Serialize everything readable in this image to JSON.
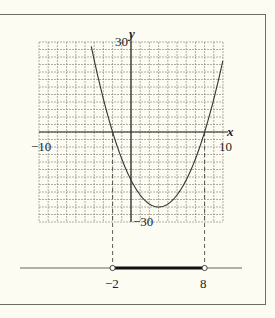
{
  "chart_data": {
    "type": "line",
    "title": "",
    "function": "y = x^2 - 6x - 16 = (x + 2)(x - 8)",
    "xlabel": "x",
    "ylabel": "y",
    "xlim": [
      -10,
      10
    ],
    "ylim": [
      -30,
      30
    ],
    "grid": true,
    "grid_x_step": 1,
    "grid_y_step": 2.5,
    "tick_labels": {
      "x_min": "−10",
      "x_max": "10",
      "y_max": "30",
      "y_min": "−30"
    },
    "series": [
      {
        "name": "parabola",
        "x": [
          -4.42,
          -4,
          -3,
          -2,
          -1,
          0,
          1,
          2,
          3,
          4,
          5,
          6,
          7,
          8,
          9,
          10
        ],
        "y": [
          30,
          24,
          11,
          0,
          -9,
          -16,
          -21,
          -24,
          -25,
          -24,
          -21,
          -16,
          -9,
          0,
          11,
          24
        ]
      }
    ],
    "x_intercepts": [
      -2,
      8
    ],
    "vertex": {
      "x": 3,
      "y": -25
    },
    "number_line": {
      "interval": [
        -2,
        8
      ],
      "endpoints": "open",
      "labels": [
        "−2",
        "8"
      ]
    }
  },
  "labels": {
    "x_axis_var": "x",
    "y_axis_var": "y",
    "x_min": "−10",
    "x_max": "10",
    "y_max": "30",
    "y_min": "−30",
    "nl_left": "−2",
    "nl_right": "8"
  },
  "colors": {
    "background": "#fdfcf2",
    "grid": "#7a7a74",
    "curve": "#333333",
    "interval": "#111111"
  }
}
